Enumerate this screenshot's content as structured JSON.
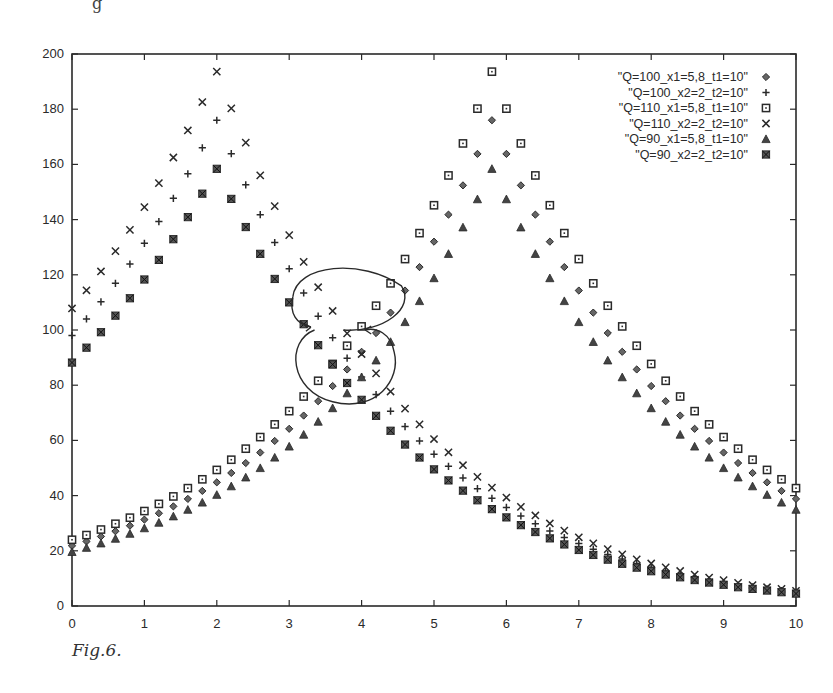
{
  "figure": {
    "caption": "Fig.6.",
    "top_mark": "g"
  },
  "chart_data": {
    "type": "scatter",
    "title": "",
    "xlabel": "",
    "ylabel": "",
    "xlim": [
      0,
      10
    ],
    "ylim": [
      0,
      200
    ],
    "x_ticks": [
      0,
      1,
      2,
      3,
      4,
      5,
      6,
      7,
      8,
      9,
      10
    ],
    "y_ticks": [
      0,
      20,
      40,
      60,
      80,
      100,
      120,
      140,
      160,
      180,
      200
    ],
    "grid": false,
    "legend_position": "top-right inside",
    "x": [
      0,
      0.2,
      0.4,
      0.6,
      0.8,
      1.0,
      1.2,
      1.4,
      1.6,
      1.8,
      2.0,
      2.2,
      2.4,
      2.6,
      2.8,
      3.0,
      3.2,
      3.4,
      3.6,
      3.8,
      4.0,
      4.2,
      4.4,
      4.6,
      4.8,
      5.0,
      5.2,
      5.4,
      5.6,
      5.8,
      6.0,
      6.2,
      6.4,
      6.6,
      6.8,
      7.0,
      7.2,
      7.4,
      7.6,
      7.8,
      8.0,
      8.2,
      8.4,
      8.6,
      8.8,
      9.0,
      9.2,
      9.4,
      9.6,
      9.8,
      10.0
    ],
    "series": [
      {
        "name": "\"Q=100_x1=5,8_t1=10\"",
        "marker": "diamond",
        "values": [
          21.8,
          23.4,
          25.2,
          27.1,
          29.1,
          31.3,
          33.6,
          36.1,
          38.8,
          41.7,
          44.8,
          48.2,
          51.8,
          55.6,
          59.8,
          64.2,
          69.0,
          74.2,
          79.7,
          85.7,
          92.1,
          98.9,
          106.3,
          114.3,
          122.8,
          132.0,
          141.8,
          152.4,
          163.8,
          176.0,
          163.8,
          152.4,
          141.8,
          132.0,
          122.8,
          114.3,
          106.3,
          98.9,
          92.1,
          85.7,
          79.7,
          74.2,
          69.0,
          64.2,
          59.8,
          55.6,
          51.8,
          48.2,
          44.8,
          41.7,
          38.8
        ]
      },
      {
        "name": "\"Q=100_x2=2_t2=10\"",
        "marker": "plus",
        "values": [
          98.0,
          104.0,
          110.2,
          116.9,
          123.9,
          131.4,
          139.3,
          147.7,
          156.6,
          166.0,
          176.0,
          163.9,
          152.6,
          141.8,
          131.7,
          122.2,
          113.4,
          105.0,
          97.2,
          89.8,
          83.0,
          76.6,
          70.6,
          65.0,
          59.8,
          55.0,
          50.6,
          46.4,
          42.5,
          39.0,
          35.7,
          32.6,
          29.8,
          27.2,
          24.8,
          22.6,
          20.6,
          18.7,
          17.0,
          15.4,
          14.0,
          12.7,
          11.5,
          10.4,
          9.4,
          8.5,
          7.6,
          6.9,
          6.2,
          5.6,
          5.0
        ]
      },
      {
        "name": "\"Q=110_x1=5,8_t1=10\"",
        "marker": "square",
        "values": [
          24.0,
          25.7,
          27.7,
          29.8,
          32.0,
          34.4,
          37.0,
          39.7,
          42.7,
          45.9,
          49.3,
          53.0,
          57.0,
          61.2,
          65.8,
          70.6,
          75.9,
          81.6,
          87.7,
          94.3,
          101.3,
          108.8,
          116.9,
          125.7,
          135.1,
          145.2,
          156.0,
          167.6,
          180.2,
          193.6,
          180.2,
          167.6,
          156.0,
          145.2,
          135.1,
          125.7,
          116.9,
          108.8,
          101.3,
          94.3,
          87.7,
          81.6,
          75.9,
          70.6,
          65.8,
          61.2,
          57.0,
          53.0,
          49.3,
          45.9,
          42.7
        ]
      },
      {
        "name": "\"Q=110_x2=2_t2=10\"",
        "marker": "cross",
        "values": [
          107.8,
          114.4,
          121.2,
          128.6,
          136.3,
          144.5,
          153.2,
          162.5,
          172.3,
          182.6,
          193.6,
          180.3,
          167.9,
          156.0,
          144.9,
          134.4,
          124.7,
          115.5,
          106.9,
          98.8,
          91.3,
          84.3,
          77.7,
          71.5,
          65.8,
          60.5,
          55.7,
          51.0,
          46.8,
          42.9,
          39.3,
          35.9,
          32.8,
          29.9,
          27.3,
          24.9,
          22.7,
          20.6,
          18.7,
          16.9,
          15.4,
          14.0,
          12.7,
          11.4,
          10.3,
          9.4,
          8.4,
          7.6,
          6.8,
          6.2,
          5.5
        ]
      },
      {
        "name": "\"Q=90_x1=5,8_t1=10\"",
        "marker": "triangle",
        "values": [
          19.6,
          21.1,
          22.7,
          24.4,
          26.2,
          28.2,
          30.2,
          32.5,
          34.9,
          37.5,
          40.3,
          43.4,
          46.6,
          50.0,
          53.8,
          57.8,
          62.1,
          66.8,
          71.7,
          77.1,
          82.9,
          89.0,
          95.7,
          102.9,
          110.5,
          118.8,
          127.6,
          137.2,
          147.4,
          158.4,
          147.4,
          137.2,
          127.6,
          118.8,
          110.5,
          102.9,
          95.7,
          89.0,
          82.9,
          77.1,
          71.7,
          66.8,
          62.1,
          57.8,
          53.8,
          50.0,
          46.6,
          43.4,
          40.3,
          37.5,
          34.9
        ]
      },
      {
        "name": "\"Q=90_x2=2_t2=10\"",
        "marker": "star",
        "values": [
          88.2,
          93.6,
          99.2,
          105.2,
          111.5,
          118.3,
          125.4,
          132.9,
          140.9,
          149.4,
          158.4,
          147.5,
          137.3,
          127.6,
          118.5,
          110.0,
          102.1,
          94.5,
          87.5,
          80.8,
          74.7,
          68.9,
          63.5,
          58.5,
          53.8,
          49.5,
          45.5,
          41.8,
          38.3,
          35.1,
          32.1,
          29.3,
          26.8,
          24.5,
          22.3,
          20.3,
          18.5,
          16.8,
          15.3,
          13.9,
          12.6,
          11.4,
          10.4,
          9.4,
          8.5,
          7.7,
          6.8,
          6.2,
          5.6,
          5.0,
          4.5
        ]
      }
    ],
    "annotations": [
      {
        "type": "hand-drawn ellipse with arrow",
        "center": [
          3.9,
          107
        ],
        "note": "upper crossing region"
      },
      {
        "type": "hand-drawn ellipse with arrow",
        "center": [
          3.7,
          87
        ],
        "note": "lower crossing region"
      }
    ],
    "colors": {
      "ink": "#2a2a2a",
      "background": "#ffffff"
    }
  }
}
